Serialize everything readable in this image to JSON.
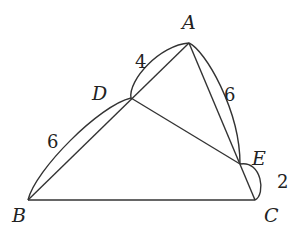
{
  "diagram": {
    "type": "geometry",
    "points": {
      "A": {
        "label": "A",
        "x": 189,
        "y": 43
      },
      "B": {
        "label": "B",
        "x": 28,
        "y": 200
      },
      "C": {
        "label": "C",
        "x": 255,
        "y": 200
      },
      "D": {
        "label": "D",
        "x": 131,
        "y": 98
      },
      "E": {
        "label": "E",
        "x": 240,
        "y": 164
      }
    },
    "segments": [
      "AB",
      "AC",
      "BC",
      "DE"
    ],
    "measurements": [
      {
        "segment": "AD",
        "value": "4"
      },
      {
        "segment": "BD",
        "value": "6"
      },
      {
        "segment": "AE",
        "value": "6"
      },
      {
        "segment": "EC",
        "value": "2"
      }
    ]
  }
}
